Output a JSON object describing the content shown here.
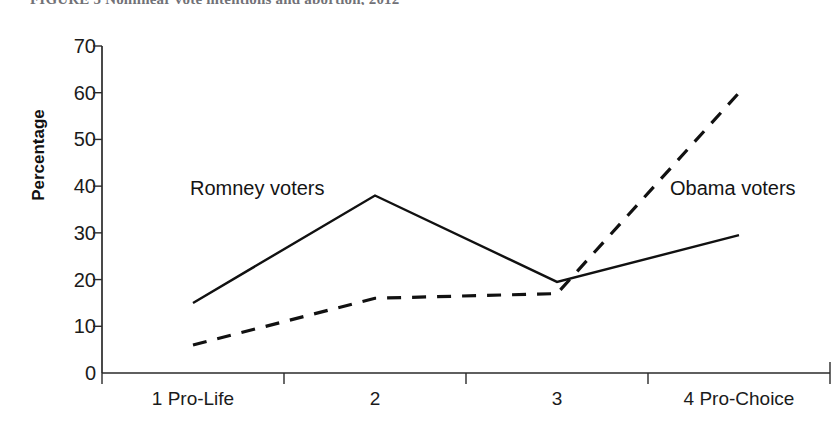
{
  "caption": {
    "text": "FIGURE 5  Nonlinear vote intentions and abortion, 2012"
  },
  "chart_data": {
    "type": "line",
    "title": "",
    "xlabel": "",
    "ylabel": "Percentage",
    "categories": [
      "1 Pro-Life",
      "2",
      "3",
      "4 Pro-Choice"
    ],
    "yticks": [
      0,
      10,
      20,
      30,
      40,
      50,
      60,
      70
    ],
    "ylim": [
      0,
      70
    ],
    "grid": false,
    "legend_position": "inline-annotations",
    "series": [
      {
        "name": "Romney voters",
        "style": "solid",
        "color": "#111111",
        "values": [
          15,
          38,
          19.5,
          29.5
        ]
      },
      {
        "name": "Obama voters",
        "style": "dashed",
        "color": "#111111",
        "values": [
          6,
          16,
          17,
          60
        ]
      }
    ]
  },
  "annotations": {
    "romney": "Romney voters",
    "obama": "Obama voters"
  }
}
